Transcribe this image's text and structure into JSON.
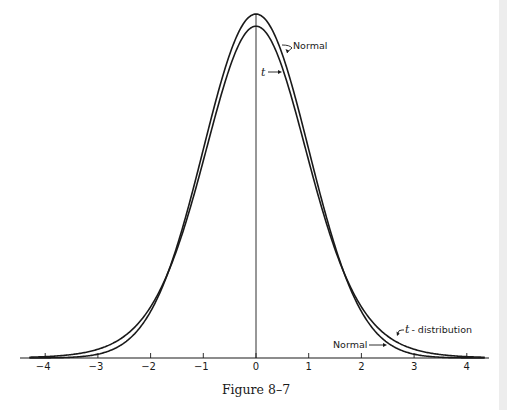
{
  "chart_data": {
    "type": "line",
    "title": "",
    "caption": "Figure 8–7",
    "xlabel": "",
    "ylabel": "",
    "xlim": [
      -4.3,
      4.4
    ],
    "ylim": [
      0,
      0.4
    ],
    "grid": false,
    "legend": "inline annotations",
    "x_ticks": [
      -4,
      -3,
      -2,
      -1,
      0,
      1,
      2,
      3,
      4
    ],
    "x_tick_labels": [
      "−4",
      "−3",
      "−2",
      "−1",
      "0",
      "1",
      "2",
      "3",
      "4"
    ],
    "series": [
      {
        "name": "Normal",
        "kind": "standard normal density",
        "peak": 0.399
      },
      {
        "name": "t-distribution",
        "kind": "Student t density",
        "peak": 0.39
      }
    ],
    "annotations": [
      {
        "text": "Normal",
        "target": "normal curve near peak (right side)"
      },
      {
        "text": "t",
        "target": "t curve near peak (right side)"
      },
      {
        "text": "t - distribution",
        "target": "t curve right tail"
      },
      {
        "text": "Normal",
        "target": "normal curve right tail"
      }
    ]
  },
  "labels": {
    "normal_top": "Normal",
    "t_top": "t",
    "t_tail_italic": "t",
    "t_tail_rest": "- distribution",
    "normal_tail": "Normal",
    "caption": "Figure 8–7",
    "ticks": [
      "−4",
      "−3",
      "−2",
      "−1",
      "0",
      "1",
      "2",
      "3",
      "4"
    ]
  }
}
